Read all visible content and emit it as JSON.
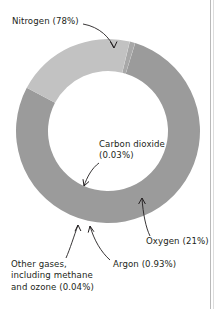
{
  "figure": {
    "name": "atmosphere-composition-donut",
    "background": "#ffffff",
    "border_color": "#b9b9b9"
  },
  "labels": {
    "nitrogen": "Nitrogen (78%)",
    "carbon_dioxide": "Carbon dioxide\n(0.03%)",
    "oxygen": "Oxygen (21%)",
    "argon": "Argon (0.93%)",
    "other_gases": "Other gases,\nincluding methane\nand ozone (0.04%)"
  },
  "chart_data": {
    "type": "pie",
    "title": "",
    "subtitle": "",
    "variant": "donut",
    "center": [
      108,
      131
    ],
    "outer_radius": 92,
    "inner_radius": 60,
    "start_angle_deg": 208,
    "direction": "counterclockwise",
    "grid": false,
    "legend": "none",
    "labels_style": "callout-arrows",
    "unit": "percent",
    "categories": [
      "Nitrogen",
      "Other gases, including methane and ozone",
      "Argon",
      "Carbon dioxide",
      "Oxygen"
    ],
    "values": [
      78,
      0.04,
      0.93,
      0.03,
      21
    ],
    "value_labels": [
      "78%",
      "0.04%",
      "0.93%",
      "0.03%",
      "21%"
    ],
    "colors": [
      "#9b9b9b",
      "#cfcfcf",
      "#a8a8a8",
      "#e4e4e4",
      "#c2c2c2"
    ],
    "annotations": [
      "Nitrogen (78%)",
      "Carbon dioxide (0.03%)",
      "Oxygen (21%)",
      "Argon (0.93%)",
      "Other gases, including methane and ozone (0.04%)"
    ]
  }
}
